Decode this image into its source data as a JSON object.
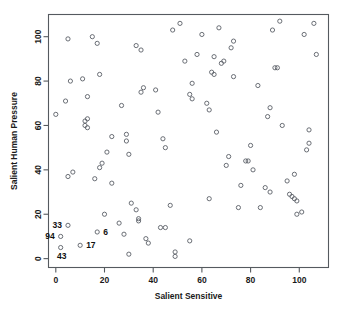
{
  "chart_data": {
    "type": "scatter",
    "title": "",
    "xlabel": "Salient Sensitive",
    "ylabel": "Salient Human Pressure",
    "xlim": [
      -3,
      112
    ],
    "ylim": [
      -4,
      110
    ],
    "xticks": [
      0,
      20,
      40,
      60,
      80,
      100
    ],
    "yticks": [
      0,
      20,
      40,
      60,
      80,
      100
    ],
    "xtick_labels": [
      "0",
      "20",
      "40",
      "60",
      "80",
      "100"
    ],
    "ytick_labels": [
      "0",
      "20",
      "40",
      "60",
      "80",
      "100"
    ],
    "grid": false,
    "legend": "none",
    "marker": "open-circle",
    "points": [
      [
        5,
        99
      ],
      [
        4,
        71
      ],
      [
        0,
        65
      ],
      [
        5,
        37
      ],
      [
        7,
        39
      ],
      [
        6,
        80
      ],
      [
        11,
        81
      ],
      [
        13,
        73
      ],
      [
        12,
        62
      ],
      [
        12,
        60
      ],
      [
        13,
        63
      ],
      [
        13,
        59
      ],
      [
        15,
        100
      ],
      [
        17,
        97
      ],
      [
        18,
        83
      ],
      [
        16,
        36
      ],
      [
        18,
        41
      ],
      [
        19,
        43
      ],
      [
        21,
        48
      ],
      [
        23,
        55
      ],
      [
        23,
        34
      ],
      [
        27,
        69
      ],
      [
        29,
        56
      ],
      [
        29,
        53
      ],
      [
        30,
        47
      ],
      [
        33,
        96
      ],
      [
        35,
        94
      ],
      [
        36,
        77
      ],
      [
        35,
        75
      ],
      [
        41,
        76
      ],
      [
        42,
        66
      ],
      [
        44,
        54
      ],
      [
        45,
        50
      ],
      [
        48,
        103
      ],
      [
        51,
        106
      ],
      [
        53,
        89
      ],
      [
        55,
        74
      ],
      [
        56,
        72
      ],
      [
        56,
        79
      ],
      [
        58,
        92
      ],
      [
        60,
        101
      ],
      [
        62,
        70
      ],
      [
        63,
        67
      ],
      [
        65,
        91
      ],
      [
        64,
        84
      ],
      [
        65,
        83
      ],
      [
        66,
        57
      ],
      [
        68,
        88
      ],
      [
        69,
        89
      ],
      [
        67,
        104
      ],
      [
        70,
        42
      ],
      [
        71,
        46
      ],
      [
        72,
        95
      ],
      [
        73,
        98
      ],
      [
        73,
        82
      ],
      [
        76,
        33
      ],
      [
        78,
        44
      ],
      [
        79,
        44
      ],
      [
        80,
        51
      ],
      [
        81,
        40
      ],
      [
        83,
        78
      ],
      [
        84,
        23
      ],
      [
        86,
        32
      ],
      [
        87,
        64
      ],
      [
        88,
        68
      ],
      [
        88,
        30
      ],
      [
        89,
        103
      ],
      [
        90,
        86
      ],
      [
        91,
        86
      ],
      [
        92,
        107
      ],
      [
        93,
        60
      ],
      [
        95,
        35
      ],
      [
        96,
        29
      ],
      [
        97,
        28
      ],
      [
        98,
        38
      ],
      [
        98,
        27
      ],
      [
        99,
        26
      ],
      [
        99,
        20
      ],
      [
        101,
        21
      ],
      [
        102,
        101
      ],
      [
        103,
        49
      ],
      [
        104,
        52
      ],
      [
        104,
        58
      ],
      [
        106,
        106
      ],
      [
        107,
        92
      ],
      [
        20,
        20
      ],
      [
        26,
        16
      ],
      [
        28,
        11
      ],
      [
        30,
        2
      ],
      [
        31,
        25
      ],
      [
        33,
        22
      ],
      [
        34,
        17
      ],
      [
        34,
        18
      ],
      [
        37,
        9
      ],
      [
        38,
        7
      ],
      [
        43,
        14
      ],
      [
        45,
        14
      ],
      [
        47,
        24
      ],
      [
        49,
        3
      ],
      [
        49,
        1
      ],
      [
        55,
        8
      ],
      [
        63,
        27
      ],
      [
        75,
        23
      ],
      [
        5,
        15
      ],
      [
        2,
        10
      ],
      [
        2,
        5
      ],
      [
        10,
        6
      ],
      [
        17,
        12
      ]
    ],
    "labeled_points": [
      {
        "label": "33",
        "x": 5,
        "y": 15,
        "anchor": "left"
      },
      {
        "label": "94",
        "x": 2,
        "y": 10,
        "anchor": "left"
      },
      {
        "label": "43",
        "x": 2,
        "y": 5,
        "anchor": "below"
      },
      {
        "label": "17",
        "x": 10,
        "y": 6,
        "anchor": "right"
      },
      {
        "label": "6",
        "x": 17,
        "y": 12,
        "anchor": "right"
      }
    ],
    "colors": {
      "marker_stroke": "#5a5f66",
      "frame": "#555a5f",
      "text": "#1a1a1a",
      "background": "#ffffff"
    }
  }
}
